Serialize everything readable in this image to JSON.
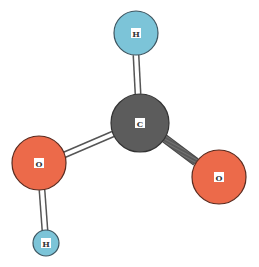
{
  "diagram": {
    "type": "molecule-ball-and-stick",
    "atoms": [
      {
        "id": "h_top",
        "symbol": "H",
        "cx": 136,
        "cy": 33,
        "r": 22,
        "color": "#7cc4d8"
      },
      {
        "id": "c",
        "symbol": "C",
        "cx": 140,
        "cy": 123,
        "r": 29,
        "color": "#5c5c5c"
      },
      {
        "id": "o_left",
        "symbol": "O",
        "cx": 39,
        "cy": 163,
        "r": 27,
        "color": "#ec6a4a"
      },
      {
        "id": "o_right",
        "symbol": "O",
        "cx": 219,
        "cy": 177,
        "r": 27,
        "color": "#ec6a4a"
      },
      {
        "id": "h_bottom",
        "symbol": "H",
        "cx": 46,
        "cy": 243,
        "r": 13,
        "color": "#7cc4d8"
      }
    ],
    "bonds": [
      {
        "from": "h_top",
        "to": "c",
        "style": "hollow"
      },
      {
        "from": "c",
        "to": "o_left",
        "style": "hollow"
      },
      {
        "from": "c",
        "to": "o_right",
        "style": "striped"
      },
      {
        "from": "o_left",
        "to": "h_bottom",
        "style": "hollow"
      }
    ]
  }
}
